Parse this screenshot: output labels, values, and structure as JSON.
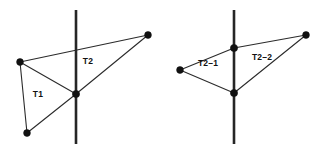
{
  "figure": {
    "background_color": "#ffffff",
    "line_color": "#2b2b2b",
    "cut_line_color": "#262626",
    "vertex_color": "#111111",
    "width": 325,
    "height": 151
  },
  "panels": [
    {
      "id": "left",
      "name": "before-split",
      "cut_line": {
        "x": 76,
        "y1": 10,
        "y2": 144
      },
      "vertices": [
        {
          "id": "A",
          "x": 20,
          "y": 62
        },
        {
          "id": "B",
          "x": 27,
          "y": 133
        },
        {
          "id": "C",
          "x": 76,
          "y": 94
        },
        {
          "id": "D",
          "x": 148,
          "y": 35
        }
      ],
      "edges": [
        {
          "from": "A",
          "to": "B"
        },
        {
          "from": "B",
          "to": "C"
        },
        {
          "from": "C",
          "to": "A"
        },
        {
          "from": "A",
          "to": "D"
        },
        {
          "from": "D",
          "to": "C"
        }
      ],
      "labels": [
        {
          "text": "T1",
          "x": 38,
          "y": 95
        },
        {
          "text": "T2",
          "x": 88,
          "y": 62
        }
      ]
    },
    {
      "id": "right",
      "name": "after-split",
      "cut_line": {
        "x": 234,
        "y1": 10,
        "y2": 144
      },
      "vertices": [
        {
          "id": "E",
          "x": 180,
          "y": 70
        },
        {
          "id": "F",
          "x": 234,
          "y": 48
        },
        {
          "id": "G",
          "x": 234,
          "y": 93
        },
        {
          "id": "H",
          "x": 306,
          "y": 35
        }
      ],
      "edges": [
        {
          "from": "E",
          "to": "F"
        },
        {
          "from": "F",
          "to": "H"
        },
        {
          "from": "H",
          "to": "G"
        },
        {
          "from": "G",
          "to": "E"
        },
        {
          "from": "F",
          "to": "G"
        }
      ],
      "labels": [
        {
          "text": "T2–1",
          "x": 220,
          "y": 64
        },
        {
          "text": "T2–2",
          "x": 262,
          "y": 58
        }
      ]
    }
  ]
}
